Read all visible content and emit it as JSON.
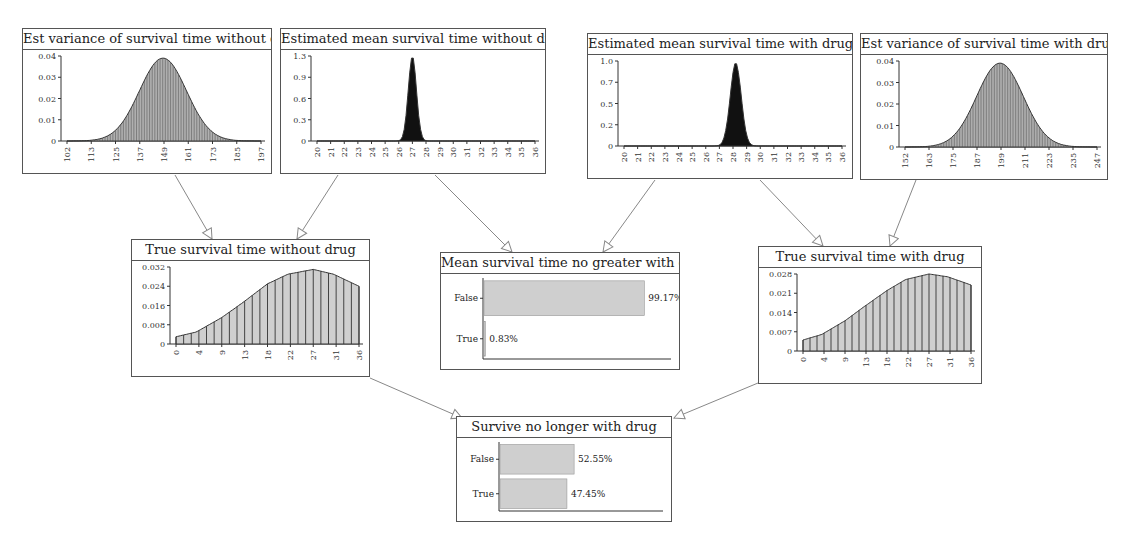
{
  "diagram": {
    "nodes": [
      {
        "id": "var_without",
        "title": "Est variance of survival time without drug",
        "box": [
          22,
          28,
          250,
          146
        ],
        "kind": "density",
        "y_ticks": [
          "0.04",
          "0.03",
          "0.02",
          "0.01",
          "0"
        ],
        "x_ticks": [
          "102",
          "113",
          "125",
          "137",
          "149",
          "161",
          "173",
          "185",
          "197"
        ],
        "fill": "hatched"
      },
      {
        "id": "mean_without",
        "title": "Estimated mean survival time without drug",
        "box": [
          280,
          28,
          266,
          146
        ],
        "kind": "density",
        "y_ticks": [
          "1.3",
          "0.9",
          "0.6",
          "0.3",
          "0"
        ],
        "x_ticks": [
          "20",
          "21",
          "22",
          "23",
          "24",
          "25",
          "26",
          "27",
          "28",
          "29",
          "30",
          "31",
          "32",
          "33",
          "34",
          "35",
          "36"
        ],
        "fill": "solid"
      },
      {
        "id": "mean_with",
        "title": "Estimated mean survival time with drug",
        "box": [
          587,
          33,
          266,
          146
        ],
        "kind": "density",
        "y_ticks": [
          "1.0",
          "0.7",
          "0.5",
          "0.2",
          "0"
        ],
        "x_ticks": [
          "20",
          "21",
          "22",
          "23",
          "24",
          "25",
          "26",
          "27",
          "28",
          "29",
          "30",
          "31",
          "32",
          "33",
          "34",
          "35",
          "36"
        ],
        "fill": "solid"
      },
      {
        "id": "var_with",
        "title": "Est variance of survival time with drug",
        "box": [
          860,
          33,
          248,
          147
        ],
        "kind": "density",
        "y_ticks": [
          "0.04",
          "0.03",
          "0.02",
          "0.01",
          "0"
        ],
        "x_ticks": [
          "152",
          "163",
          "175",
          "187",
          "199",
          "211",
          "223",
          "235",
          "247"
        ],
        "fill": "hatched"
      },
      {
        "id": "true_without",
        "title": "True survival time without drug",
        "box": [
          131,
          239,
          239,
          138
        ],
        "kind": "density",
        "y_ticks": [
          "0.032",
          "0.024",
          "0.016",
          "0.008",
          "0"
        ],
        "x_ticks": [
          "0",
          "4",
          "9",
          "13",
          "18",
          "22",
          "27",
          "31",
          "36"
        ],
        "fill": "bars"
      },
      {
        "id": "mean_no_greater",
        "title": "Mean survival time no greater with drug",
        "box": [
          440,
          252,
          240,
          118
        ],
        "kind": "bar",
        "states": [
          {
            "label": "False",
            "value": 99.17,
            "text": "99.17%"
          },
          {
            "label": "True",
            "value": 0.83,
            "text": "0.83%"
          }
        ]
      },
      {
        "id": "true_with",
        "title": "True survival time with drug",
        "box": [
          758,
          246,
          224,
          138
        ],
        "kind": "density",
        "y_ticks": [
          "0.028",
          "0.021",
          "0.014",
          "0.007",
          "0"
        ],
        "x_ticks": [
          "0",
          "4",
          "9",
          "13",
          "18",
          "22",
          "27",
          "31",
          "36"
        ],
        "fill": "bars"
      },
      {
        "id": "survive_no_longer",
        "title": "Survive no longer with drug",
        "box": [
          456,
          416,
          216,
          106
        ],
        "kind": "bar",
        "states": [
          {
            "label": "False",
            "value": 52.55,
            "text": "52.55%"
          },
          {
            "label": "True",
            "value": 47.45,
            "text": "47.45%"
          }
        ]
      }
    ],
    "edges": [
      {
        "from": "var_without",
        "to": "true_without"
      },
      {
        "from": "mean_without",
        "to": "true_without"
      },
      {
        "from": "mean_without",
        "to": "mean_no_greater"
      },
      {
        "from": "mean_with",
        "to": "mean_no_greater"
      },
      {
        "from": "mean_with",
        "to": "true_with"
      },
      {
        "from": "var_with",
        "to": "true_with"
      },
      {
        "from": "true_without",
        "to": "survive_no_longer"
      },
      {
        "from": "true_with",
        "to": "survive_no_longer"
      }
    ]
  },
  "chart_data": [
    {
      "type": "area",
      "title": "Est variance of survival time without drug",
      "x_ticks": [
        102,
        113,
        125,
        137,
        149,
        161,
        173,
        185,
        197
      ],
      "xlim": [
        102,
        197
      ],
      "ylim": [
        0,
        0.04
      ],
      "y_ticks": [
        0,
        0.01,
        0.02,
        0.03,
        0.04
      ],
      "peak": {
        "x": 149,
        "y": 0.039
      },
      "sd": 11.5
    },
    {
      "type": "area",
      "title": "Estimated mean survival time without drug",
      "x_ticks": [
        20,
        21,
        22,
        23,
        24,
        25,
        26,
        27,
        28,
        29,
        30,
        31,
        32,
        33,
        34,
        35,
        36
      ],
      "xlim": [
        20,
        36
      ],
      "ylim": [
        0,
        1.3
      ],
      "y_ticks": [
        0,
        0.3,
        0.6,
        0.9,
        1.3
      ],
      "peak": {
        "x": 27,
        "y": 1.3
      },
      "sd": 0.3
    },
    {
      "type": "area",
      "title": "Estimated mean survival time with drug",
      "x_ticks": [
        20,
        21,
        22,
        23,
        24,
        25,
        26,
        27,
        28,
        29,
        30,
        31,
        32,
        33,
        34,
        35,
        36
      ],
      "xlim": [
        20,
        36
      ],
      "ylim": [
        0,
        1.0
      ],
      "y_ticks": [
        0,
        0.2,
        0.5,
        0.7,
        1.0
      ],
      "peak": {
        "x": 28.2,
        "y": 0.98
      },
      "sd": 0.4
    },
    {
      "type": "area",
      "title": "Est variance of survival time with drug",
      "x_ticks": [
        152,
        163,
        175,
        187,
        199,
        211,
        223,
        235,
        247
      ],
      "xlim": [
        152,
        247
      ],
      "ylim": [
        0,
        0.04
      ],
      "y_ticks": [
        0,
        0.01,
        0.02,
        0.03,
        0.04
      ],
      "peak": {
        "x": 199,
        "y": 0.039
      },
      "sd": 11.5
    },
    {
      "type": "area",
      "title": "True survival time without drug",
      "x_ticks": [
        0,
        4,
        9,
        13,
        18,
        22,
        27,
        31,
        36
      ],
      "xlim": [
        0,
        36
      ],
      "ylim": [
        0,
        0.032
      ],
      "y_ticks": [
        0,
        0.008,
        0.016,
        0.024,
        0.032
      ],
      "x": [
        0,
        4,
        9,
        13,
        18,
        22,
        27,
        31,
        36
      ],
      "values": [
        0.003,
        0.005,
        0.011,
        0.017,
        0.025,
        0.029,
        0.031,
        0.029,
        0.024
      ]
    },
    {
      "type": "bar",
      "title": "Mean survival time no greater with drug",
      "categories": [
        "False",
        "True"
      ],
      "values": [
        99.17,
        0.83
      ]
    },
    {
      "type": "area",
      "title": "True survival time with drug",
      "x_ticks": [
        0,
        4,
        9,
        13,
        18,
        22,
        27,
        31,
        36
      ],
      "xlim": [
        0,
        36
      ],
      "ylim": [
        0,
        0.028
      ],
      "y_ticks": [
        0,
        0.007,
        0.014,
        0.021,
        0.028
      ],
      "x": [
        0,
        4,
        9,
        13,
        18,
        22,
        27,
        31,
        36
      ],
      "values": [
        0.004,
        0.006,
        0.011,
        0.016,
        0.022,
        0.026,
        0.028,
        0.027,
        0.024
      ]
    },
    {
      "type": "bar",
      "title": "Survive no longer with drug",
      "categories": [
        "False",
        "True"
      ],
      "values": [
        52.55,
        47.45
      ]
    }
  ],
  "colors": {
    "border": "#555555",
    "fill_gray": "#cfcfcf",
    "fill_dark": "#111111",
    "edge": "#888888",
    "hatch": "#444444"
  }
}
